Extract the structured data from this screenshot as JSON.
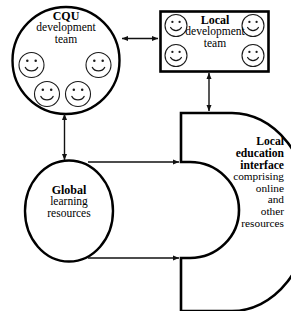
{
  "diagram": {
    "background_color": "#ffffff",
    "line_color": "#000000",
    "nodes": [
      {
        "id": "cqu-development-team",
        "shape": "circle",
        "lines": [
          "CQU",
          "development",
          "team"
        ],
        "bold_lines": [
          "CQU"
        ],
        "person_icon_count": 4,
        "person_icon_name": "smiley-face-icon"
      },
      {
        "id": "local-development-team",
        "shape": "rectangle",
        "lines": [
          "Local",
          "development",
          "team"
        ],
        "bold_lines": [
          "Local"
        ],
        "person_icon_count": 4,
        "person_icon_name": "smiley-face-icon"
      },
      {
        "id": "global-learning-resources",
        "shape": "ellipse",
        "lines": [
          "Global",
          "learning",
          "resources"
        ],
        "bold_lines": [
          "Global"
        ]
      },
      {
        "id": "local-education-interface",
        "shape": "crescent",
        "lines": [
          "Local",
          "education",
          "interface",
          "comprising",
          "online",
          "and",
          "other",
          "resources"
        ],
        "bold_lines": [
          "Local",
          "education",
          "interface"
        ]
      }
    ],
    "connectors": [
      {
        "id": "cqu-to-local-team",
        "from": "cqu-development-team",
        "to": "local-development-team",
        "style": "double-headed-arrow",
        "orientation": "horizontal"
      },
      {
        "id": "cqu-to-global-resources",
        "from": "cqu-development-team",
        "to": "global-learning-resources",
        "style": "double-headed-arrow",
        "orientation": "vertical"
      },
      {
        "id": "local-team-to-interface",
        "from": "local-development-team",
        "to": "local-education-interface",
        "style": "double-headed-arrow",
        "orientation": "vertical"
      },
      {
        "id": "global-resources-to-interface-upper",
        "from": "global-learning-resources",
        "to": "local-education-interface",
        "style": "single-headed-arrow",
        "orientation": "horizontal"
      },
      {
        "id": "global-resources-to-interface-lower",
        "from": "global-learning-resources",
        "to": "local-education-interface",
        "style": "single-headed-arrow",
        "orientation": "horizontal"
      }
    ]
  },
  "cqu": {
    "line1": "CQU",
    "line2": "development",
    "line3": "team"
  },
  "local_team": {
    "line1": "Local",
    "line2": "development",
    "line3": "team"
  },
  "global": {
    "line1": "Global",
    "line2": "learning",
    "line3": "resources"
  },
  "interface": {
    "line1": "Local",
    "line2": "education",
    "line3": "interface",
    "line4": "comprising",
    "line5": "online",
    "line6": "and",
    "line7": "other",
    "line8": "resources"
  }
}
